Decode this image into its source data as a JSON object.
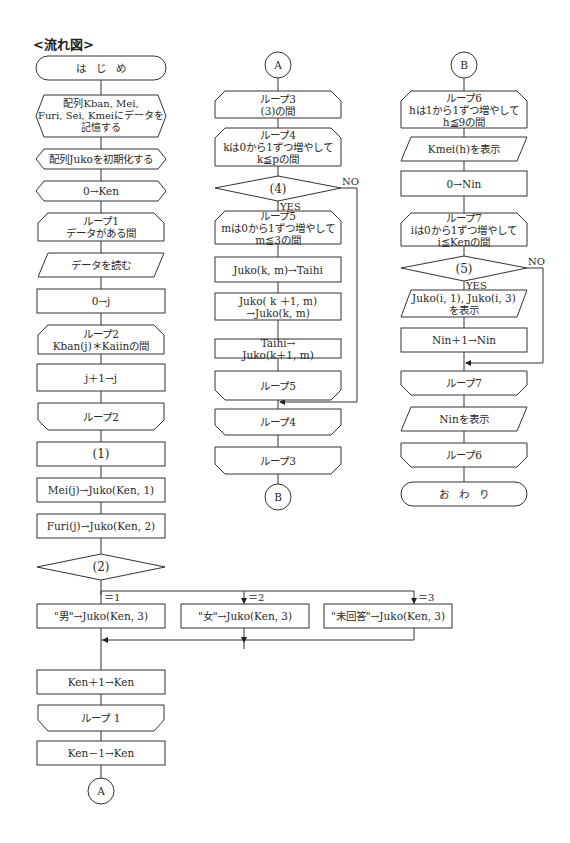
{
  "title": "<流れ図>",
  "page_mark": "—  —",
  "columns": {
    "left": {
      "nodes": [
        {
          "id": "start",
          "type": "terminal",
          "label": "は　じ　め"
        },
        {
          "id": "prep1",
          "type": "preparation",
          "label": "配列Kban, Mei,\nFuri, Sei, Kmeiにデータを\n記憶する"
        },
        {
          "id": "prep2",
          "type": "preparation",
          "label": "配列Jukoを初期化する"
        },
        {
          "id": "prep3",
          "type": "preparation",
          "label": "0→Ken"
        },
        {
          "id": "loop1_start",
          "type": "loop_start",
          "label": "ループ1\nデータがある間"
        },
        {
          "id": "read",
          "type": "io",
          "label": "データを読む"
        },
        {
          "id": "j0",
          "type": "process",
          "label": "0→j"
        },
        {
          "id": "loop2_start",
          "type": "loop_start",
          "label": "ループ2\nKban(j)＊Kaiinの間"
        },
        {
          "id": "jinc",
          "type": "process",
          "label": "j＋1→j"
        },
        {
          "id": "loop2_end",
          "type": "loop_end",
          "label": "ループ2"
        },
        {
          "id": "blank1",
          "type": "process",
          "label": "(1)"
        },
        {
          "id": "mei",
          "type": "process",
          "label": "Mei(j)→Juko(Ken, 1)"
        },
        {
          "id": "furi",
          "type": "process",
          "label": "Furi(j)→Juko(Ken, 2)"
        },
        {
          "id": "blank2",
          "type": "decision",
          "label": "(2)"
        },
        {
          "id": "male",
          "type": "process",
          "label": "\"男\"→Juko(Ken, 3)",
          "branch": "＝1"
        },
        {
          "id": "female",
          "type": "process",
          "label": "\"女\"→Juko(Ken, 3)",
          "branch": "＝2"
        },
        {
          "id": "unanswered",
          "type": "process",
          "label": "\"未回答\"→Juko(Ken, 3)",
          "branch": "＝3"
        },
        {
          "id": "keninc",
          "type": "process",
          "label": "Ken＋1→Ken"
        },
        {
          "id": "loop1_end",
          "type": "loop_end",
          "label": "ループ 1"
        },
        {
          "id": "kendec",
          "type": "process",
          "label": "Ken－1→Ken"
        },
        {
          "id": "connA_out",
          "type": "connector",
          "label": "A"
        }
      ]
    },
    "middle": {
      "nodes": [
        {
          "id": "connA_in",
          "type": "connector",
          "label": "A"
        },
        {
          "id": "loop3_start",
          "type": "loop_start",
          "label": "ループ3\n(3)の間"
        },
        {
          "id": "loop4_start",
          "type": "loop_start",
          "label": "ループ4\nkは0から1ずつ増やして\nk≦pの間"
        },
        {
          "id": "blank4",
          "type": "decision",
          "label": "(4)",
          "yes": "YES",
          "no": "NO"
        },
        {
          "id": "loop5_start",
          "type": "loop_start",
          "label": "ループ5\nmは0から1ずつ増やして\nm≦3の間"
        },
        {
          "id": "swap1",
          "type": "process",
          "label": "Juko(k, m)→Taihi"
        },
        {
          "id": "swap2",
          "type": "process",
          "label": "Juko( k ＋1, m)\n→Juko(k, m)"
        },
        {
          "id": "swap3",
          "type": "process",
          "label": "Taihi→\nJuko(k＋1, m)"
        },
        {
          "id": "loop5_end",
          "type": "loop_end",
          "label": "ループ5"
        },
        {
          "id": "loop4_end",
          "type": "loop_end",
          "label": "ループ4"
        },
        {
          "id": "loop3_end",
          "type": "loop_end",
          "label": "ループ3"
        },
        {
          "id": "connB_out",
          "type": "connector",
          "label": "B"
        }
      ]
    },
    "right": {
      "nodes": [
        {
          "id": "connB_in",
          "type": "connector",
          "label": "B"
        },
        {
          "id": "loop6_start",
          "type": "loop_start",
          "label": "ループ6\nhは1から1ずつ増やして\nh≦9の間"
        },
        {
          "id": "showKmei",
          "type": "io",
          "label": "Kmei(h)を表示"
        },
        {
          "id": "nin0",
          "type": "process",
          "label": "0→Nin"
        },
        {
          "id": "loop7_start",
          "type": "loop_start",
          "label": "ループ7\niは0から1ずつ増やして\ni≦Kenの間"
        },
        {
          "id": "blank5",
          "type": "decision",
          "label": "(5)",
          "yes": "YES",
          "no": "NO"
        },
        {
          "id": "showJuko",
          "type": "io",
          "label": "Juko(i, 1), Juko(i, 3)\nを表示"
        },
        {
          "id": "nininc",
          "type": "process",
          "label": "Nin＋1→Nin"
        },
        {
          "id": "loop7_end",
          "type": "loop_end",
          "label": "ループ7"
        },
        {
          "id": "showNin",
          "type": "io",
          "label": "Ninを表示"
        },
        {
          "id": "loop6_end",
          "type": "loop_end",
          "label": "ループ6"
        },
        {
          "id": "end",
          "type": "terminal",
          "label": "お　わ　り"
        }
      ]
    }
  }
}
